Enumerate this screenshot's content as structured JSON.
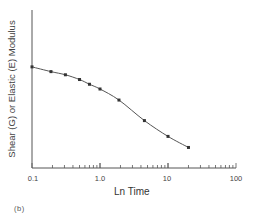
{
  "chart_data": {
    "type": "line",
    "title": "",
    "xlabel": "Ln Time",
    "ylabel": "Shear (G) or Elastic (E) Modulus",
    "x_scale": "log",
    "xlim": [
      0.1,
      100
    ],
    "ylim": [
      0,
      100
    ],
    "x_ticks": [
      "0.1",
      "1.0",
      "10",
      "100"
    ],
    "y_ticks": [],
    "grid": false,
    "legend": null,
    "panel_label": "(b)",
    "series": [
      {
        "name": "Modulus",
        "marker": "square",
        "x": [
          0.1,
          0.19,
          0.31,
          0.5,
          0.7,
          1.0,
          1.9,
          4.5,
          10,
          20
        ],
        "y": [
          64,
          61,
          59,
          56,
          53,
          50,
          43,
          30,
          20,
          13
        ]
      }
    ]
  },
  "labels": {
    "xlabel": "Ln Time",
    "ylabel": "Shear (G) or Elastic (E) Modulus",
    "panel": "(b)",
    "ticks": [
      "0.1",
      "1.0",
      "10",
      "100"
    ]
  }
}
